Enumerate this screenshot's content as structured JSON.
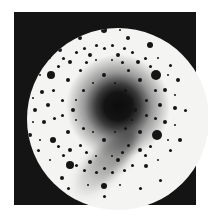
{
  "image": {
    "description": "Laue diffraction pattern: circular bright field inside a dark square frame with a dark central blob, a gray streak toward lower-left, and many black diffraction spots",
    "colors": {
      "frame": "#141414",
      "field": "#f4f4f2",
      "spot": "#151515"
    }
  },
  "spots": [
    [
      156,
      75,
      5
    ],
    [
      157,
      135,
      5
    ],
    [
      51,
      75,
      4
    ],
    [
      104,
      30,
      3
    ],
    [
      104,
      186,
      3
    ],
    [
      70,
      165,
      4
    ],
    [
      53,
      140,
      3
    ],
    [
      150,
      45,
      3
    ],
    [
      128,
      38,
      2
    ],
    [
      80,
      38,
      2
    ],
    [
      60,
      50,
      2
    ],
    [
      146,
      166,
      2
    ],
    [
      62,
      178,
      2
    ],
    [
      35,
      110,
      2
    ],
    [
      175,
      108,
      2
    ],
    [
      30,
      85,
      2
    ],
    [
      178,
      80,
      2
    ],
    [
      180,
      140,
      2
    ],
    [
      30,
      135,
      2
    ],
    [
      118,
      55,
      2
    ],
    [
      90,
      55,
      2
    ],
    [
      138,
      62,
      2
    ],
    [
      70,
      62,
      2
    ],
    [
      140,
      150,
      2
    ],
    [
      70,
      150,
      2
    ],
    [
      118,
      160,
      2
    ],
    [
      90,
      162,
      2
    ],
    [
      160,
      105,
      2
    ],
    [
      48,
      105,
      2
    ],
    [
      165,
      90,
      2
    ],
    [
      165,
      122,
      2
    ],
    [
      42,
      92,
      2
    ],
    [
      44,
      122,
      2
    ],
    [
      112,
      45,
      1.5
    ],
    [
      96,
      45,
      1.5
    ],
    [
      124,
      48,
      1.5
    ],
    [
      84,
      48,
      1.5
    ],
    [
      132,
      52,
      1.5
    ],
    [
      76,
      52,
      1.5
    ],
    [
      145,
      58,
      1.5
    ],
    [
      63,
      58,
      1.5
    ],
    [
      150,
      66,
      1.5
    ],
    [
      58,
      66,
      1.5
    ],
    [
      155,
      90,
      1.5
    ],
    [
      53,
      90,
      1.5
    ],
    [
      155,
      118,
      1.5
    ],
    [
      54,
      118,
      1.5
    ],
    [
      150,
      146,
      1.5
    ],
    [
      58,
      146,
      1.5
    ],
    [
      145,
      155,
      1.5
    ],
    [
      63,
      155,
      1.5
    ],
    [
      132,
      165,
      1.5
    ],
    [
      76,
      165,
      1.5
    ],
    [
      124,
      170,
      1.5
    ],
    [
      84,
      170,
      1.5
    ],
    [
      112,
      172,
      1.5
    ],
    [
      96,
      172,
      1.5
    ],
    [
      104,
      48,
      1.5
    ],
    [
      104,
      168,
      1.5
    ],
    [
      140,
      80,
      2
    ],
    [
      68,
      80,
      2
    ],
    [
      140,
      132,
      2
    ],
    [
      68,
      132,
      2
    ],
    [
      128,
      70,
      1.5
    ],
    [
      80,
      70,
      1.5
    ],
    [
      128,
      145,
      1.5
    ],
    [
      80,
      145,
      1.5
    ],
    [
      122,
      62,
      1.5
    ],
    [
      86,
      62,
      1.5
    ],
    [
      122,
      152,
      1.5
    ],
    [
      86,
      152,
      1.5
    ],
    [
      146,
      100,
      1.5
    ],
    [
      62,
      100,
      1.5
    ],
    [
      146,
      115,
      1.5
    ],
    [
      62,
      115,
      1.5
    ],
    [
      170,
      65,
      1.5
    ],
    [
      38,
      65,
      1.5
    ],
    [
      170,
      150,
      1.5
    ],
    [
      38,
      150,
      1.5
    ],
    [
      185,
      110,
      1.5
    ],
    [
      24,
      110,
      1.5
    ],
    [
      104,
      20,
      1.5
    ],
    [
      104,
      196,
      1.5
    ],
    [
      140,
      28,
      1.5
    ],
    [
      68,
      28,
      1.5
    ],
    [
      140,
      188,
      1.5
    ],
    [
      68,
      188,
      1.5
    ],
    [
      160,
      35,
      1.5
    ],
    [
      48,
      35,
      1.5
    ],
    [
      160,
      180,
      1.5
    ],
    [
      48,
      180,
      1.5
    ],
    [
      175,
      95,
      1.2
    ],
    [
      175,
      125,
      1.2
    ],
    [
      33,
      98,
      1.2
    ],
    [
      33,
      122,
      1.2
    ],
    [
      120,
      30,
      1.2
    ],
    [
      88,
      30,
      1.2
    ],
    [
      120,
      185,
      1.2
    ],
    [
      88,
      185,
      1.2
    ],
    [
      135,
      110,
      2
    ],
    [
      73,
      110,
      2
    ],
    [
      104,
      75,
      2
    ],
    [
      104,
      140,
      2
    ],
    [
      125,
      90,
      1.5
    ],
    [
      83,
      90,
      1.5
    ],
    [
      125,
      128,
      1.5
    ],
    [
      83,
      128,
      1.5
    ],
    [
      115,
      83,
      1.2
    ],
    [
      93,
      83,
      1.2
    ],
    [
      115,
      132,
      1.2
    ],
    [
      93,
      132,
      1.2
    ],
    [
      158,
      58,
      1.2
    ],
    [
      50,
      58,
      1.2
    ],
    [
      158,
      160,
      1.2
    ],
    [
      50,
      160,
      1.2
    ],
    [
      168,
      75,
      1.2
    ],
    [
      40,
      75,
      1.2
    ],
    [
      168,
      140,
      1.2
    ],
    [
      40,
      140,
      1.2
    ],
    [
      96,
      60,
      1.2
    ],
    [
      112,
      60,
      1.2
    ],
    [
      96,
      156,
      1.2
    ],
    [
      112,
      156,
      1.2
    ],
    [
      132,
      100,
      1.2
    ],
    [
      76,
      100,
      1.2
    ],
    [
      132,
      120,
      1.2
    ],
    [
      76,
      120,
      1.2
    ]
  ]
}
